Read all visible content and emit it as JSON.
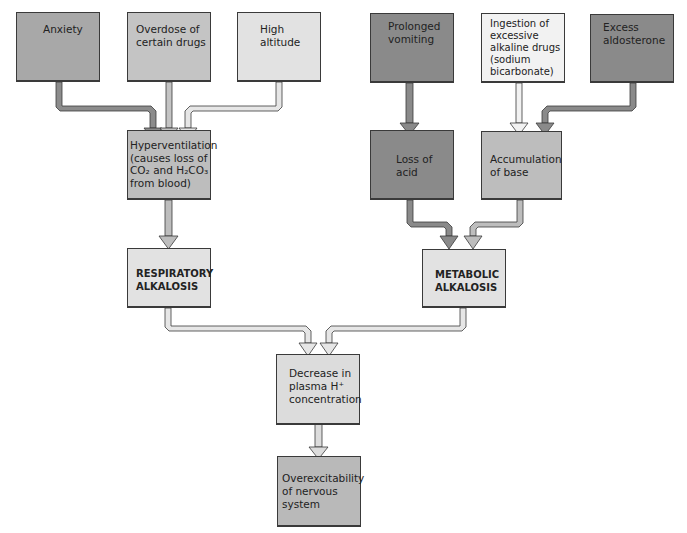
{
  "diagram": {
    "nodes": {
      "anxiety": {
        "lines": [
          "Anxiety"
        ],
        "shade": "#a8a8a8"
      },
      "overdose": {
        "lines": [
          "Overdose of",
          "certain drugs"
        ],
        "shade": "#c4c4c4"
      },
      "altitude": {
        "lines": [
          "High",
          "altitude"
        ],
        "shade": "#e2e2e2"
      },
      "vomiting": {
        "lines": [
          "Prolonged",
          "vomiting"
        ],
        "shade": "#8a8a8a"
      },
      "ingestion": {
        "lines": [
          "Ingestion of",
          "excessive",
          "alkaline drugs",
          "(sodium",
          "bicarbonate)"
        ],
        "shade": "#f2f2f2"
      },
      "aldosterone": {
        "lines": [
          "Excess",
          "aldosterone"
        ],
        "shade": "#8a8a8a"
      },
      "hyperventilation": {
        "lines": [
          "Hyperventilation",
          "(causes loss of",
          "CO₂ and H₂CO₃",
          "from blood)"
        ],
        "shade": "#bdbdbd"
      },
      "loss_acid": {
        "lines": [
          "Loss of",
          "acid"
        ],
        "shade": "#8a8a8a"
      },
      "accumulation": {
        "lines": [
          "Accumulation",
          "of base"
        ],
        "shade": "#bdbdbd"
      },
      "resp_alkalosis": {
        "lines": [
          "RESPIRATORY",
          "ALKALOSIS"
        ],
        "shade": "#e2e2e2"
      },
      "metab_alkalosis": {
        "lines": [
          "METABOLIC",
          "ALKALOSIS"
        ],
        "shade": "#e2e2e2"
      },
      "decrease_h": {
        "lines": [
          "Decrease in",
          "plasma H⁺",
          "concentration"
        ],
        "shade": "#dcdcdc"
      },
      "overexcitability": {
        "lines": [
          "Overexcitability",
          "of nervous",
          "system"
        ],
        "shade": "#b9b9b9"
      }
    },
    "edges": [
      {
        "from": "Anxiety",
        "to": "Hyperventilation"
      },
      {
        "from": "Overdose of certain drugs",
        "to": "Hyperventilation"
      },
      {
        "from": "High altitude",
        "to": "Hyperventilation"
      },
      {
        "from": "Hyperventilation",
        "to": "RESPIRATORY ALKALOSIS"
      },
      {
        "from": "Prolonged vomiting",
        "to": "Loss of acid"
      },
      {
        "from": "Ingestion of excessive alkaline drugs (sodium bicarbonate)",
        "to": "Accumulation of base"
      },
      {
        "from": "Excess aldosterone",
        "to": "Accumulation of base"
      },
      {
        "from": "Loss of acid",
        "to": "METABOLIC ALKALOSIS"
      },
      {
        "from": "Accumulation of base",
        "to": "METABOLIC ALKALOSIS"
      },
      {
        "from": "RESPIRATORY ALKALOSIS",
        "to": "Decrease in plasma H+ concentration"
      },
      {
        "from": "METABOLIC ALKALOSIS",
        "to": "Decrease in plasma H+ concentration"
      },
      {
        "from": "Decrease in plasma H+ concentration",
        "to": "Overexcitability of nervous system"
      }
    ]
  }
}
